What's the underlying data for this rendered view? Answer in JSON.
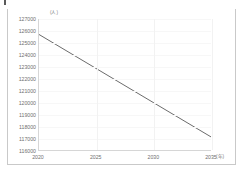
{
  "chart_data": {
    "type": "line",
    "title": "",
    "subtitle": "",
    "xlabel": "(年)",
    "ylabel": "(人)",
    "x": [
      2020,
      2035
    ],
    "series": [
      {
        "name": "人口推計",
        "values": [
          125700,
          117100
        ]
      }
    ],
    "xlim": [
      2020,
      2035
    ],
    "ylim": [
      116000,
      127000
    ],
    "x_ticks": [
      2020,
      2025,
      2030,
      2035
    ],
    "x_tick_labels": [
      "2020",
      "2025",
      "2030",
      "2035"
    ],
    "y_ticks": [
      116000,
      117000,
      118000,
      119000,
      120000,
      121000,
      122000,
      123000,
      124000,
      125000,
      126000,
      127000
    ],
    "y_tick_labels": [
      "116000",
      "117000",
      "118000",
      "119000",
      "120000",
      "121000",
      "122000",
      "123000",
      "124000",
      "125000",
      "126000",
      "127000"
    ],
    "grid": true,
    "legend": false,
    "legend_position": "none",
    "line_color": "#595959",
    "annotations": []
  },
  "axis": {
    "y_unit": "(人)",
    "x_unit": "(年)"
  },
  "colors": {
    "line": "#595959",
    "axis": "#d6d6d6",
    "frame": "#c9c9c9",
    "grid": "#f2f2f2",
    "tick_text": "#6f6f6f",
    "unit_text": "#7c7c7c",
    "background": "#ffffff"
  }
}
